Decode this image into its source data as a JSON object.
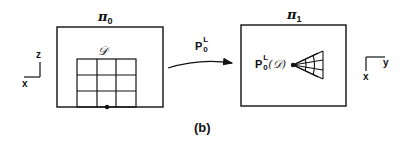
{
  "figure": {
    "caption": "(b)",
    "left_plane": {
      "label_symbol": "π",
      "label_sub": "0",
      "region_label": "𝒟",
      "grid_rows": 3,
      "grid_cols": 3,
      "axes": {
        "vertical": "z",
        "horizontal": "x"
      }
    },
    "mapping": {
      "operator": "P",
      "superscript": "L",
      "subscript": "0"
    },
    "right_plane": {
      "label_symbol": "π",
      "label_sub": "1",
      "image_label_op": "P",
      "image_label_sup": "L",
      "image_label_sub": "0",
      "image_label_arg": "(𝒟)",
      "axes": {
        "vertical": "x",
        "horizontal": "y"
      }
    },
    "colors": {
      "ink": "#111111",
      "background": "#ffffff"
    }
  }
}
